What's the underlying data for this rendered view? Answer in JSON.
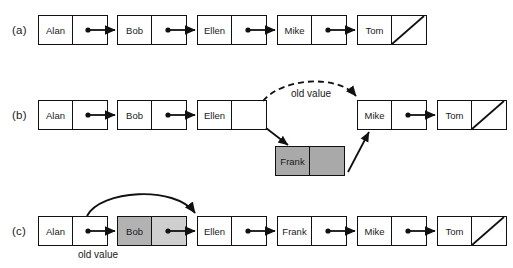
{
  "figure": {
    "background_color": "#ffffff",
    "line_color": "#111111",
    "gray_fill": "#a9a9a9",
    "gray_data_fill": "#b2b2b2",
    "gray_ptr_fill": "#cfcfcf"
  },
  "rows": [
    {
      "label": "(a)",
      "nodes": [
        {
          "name": "Alan",
          "fill": "white",
          "pointer": "arrow"
        },
        {
          "name": "Bob",
          "fill": "white",
          "pointer": "arrow"
        },
        {
          "name": "Ellen",
          "fill": "white",
          "pointer": "arrow"
        },
        {
          "name": "Mike",
          "fill": "white",
          "pointer": "arrow"
        },
        {
          "name": "Tom",
          "fill": "white",
          "pointer": "null"
        }
      ]
    },
    {
      "label": "(b)",
      "nodes": [
        {
          "name": "Alan",
          "fill": "white",
          "pointer": "arrow"
        },
        {
          "name": "Bob",
          "fill": "white",
          "pointer": "arrow"
        },
        {
          "name": "Ellen",
          "fill": "white",
          "pointer": "empty"
        },
        {
          "name": "Mike",
          "fill": "white",
          "pointer": "arrow"
        },
        {
          "name": "Tom",
          "fill": "white",
          "pointer": "null"
        }
      ],
      "inserted_node": {
        "name": "Frank",
        "fill": "gray",
        "pointer": "empty"
      },
      "annotation": "old value"
    },
    {
      "label": "(c)",
      "nodes": [
        {
          "name": "Alan",
          "fill": "white",
          "pointer": "arrow"
        },
        {
          "name": "Bob",
          "fill": "gray",
          "pointer": "arrow"
        },
        {
          "name": "Ellen",
          "fill": "white",
          "pointer": "arrow"
        },
        {
          "name": "Frank",
          "fill": "white",
          "pointer": "arrow"
        },
        {
          "name": "Mike",
          "fill": "white",
          "pointer": "arrow"
        },
        {
          "name": "Tom",
          "fill": "white",
          "pointer": "null"
        }
      ],
      "annotation": "old value"
    }
  ]
}
